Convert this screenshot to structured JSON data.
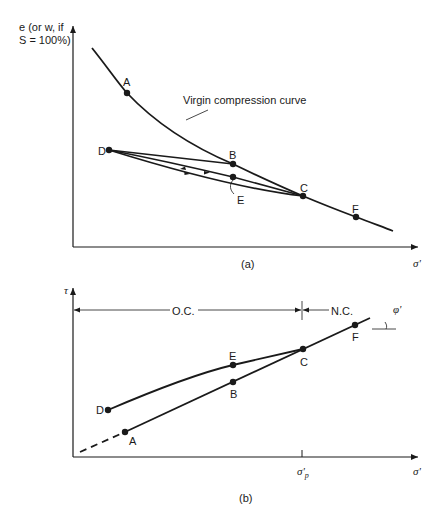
{
  "figure": {
    "panel_a": {
      "caption": "(a)",
      "y_axis_label_line1": "e (or w, if",
      "y_axis_label_line2": "S = 100%)",
      "x_axis_label": "σ'",
      "curve_annotation": "Virgin compression curve",
      "points": {
        "A": "A",
        "B": "B",
        "C": "C",
        "D": "D",
        "E": "E",
        "F": "F"
      }
    },
    "panel_b": {
      "caption": "(b)",
      "y_axis_label": "τ",
      "x_axis_label": "σ'",
      "preconsolidation_tick_label": "σ'",
      "preconsolidation_tick_sub": "p",
      "region_left": "O.C.",
      "region_right": "N.C.",
      "angle_label": "φ'",
      "points": {
        "A": "A",
        "B": "B",
        "C": "C",
        "D": "D",
        "E": "E",
        "F": "F"
      }
    },
    "colors": {
      "ink": "#1a1a1a",
      "background": "#ffffff"
    }
  }
}
